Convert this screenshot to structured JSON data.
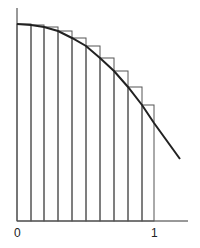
{
  "diagram": {
    "x_labels": [
      {
        "text": "0",
        "x": 17
      },
      {
        "text": "1",
        "x": 154
      }
    ],
    "rectangles": {
      "count": 10,
      "edges_x": [
        17,
        31,
        44,
        58,
        72,
        86,
        100,
        114,
        128,
        142,
        154
      ],
      "tops_y": [
        24,
        25,
        27,
        31,
        38,
        46,
        58,
        71,
        87,
        105
      ],
      "baseline_y": 221
    },
    "curve": {
      "points": [
        [
          17,
          24
        ],
        [
          31,
          25
        ],
        [
          44,
          27
        ],
        [
          58,
          31
        ],
        [
          72,
          38
        ],
        [
          86,
          46
        ],
        [
          100,
          58
        ],
        [
          114,
          71
        ],
        [
          128,
          87
        ],
        [
          142,
          105
        ],
        [
          154,
          123
        ],
        [
          180,
          159
        ]
      ]
    },
    "colors": {
      "curve": "#222222",
      "rect": "#555555",
      "axis": "#333333"
    }
  }
}
